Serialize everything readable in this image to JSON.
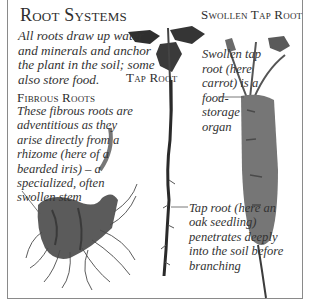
{
  "title": "Root Systems",
  "intro": "All roots draw up water and minerals and anchor the plant in the soil; some also store food.",
  "sections": {
    "fibrous": {
      "heading": "Fibrous Roots",
      "caption": "These fibrous roots are adventitious as they arise directly from a rhizome (here of a bearded iris) – a specialized, often swollen stem",
      "specimen": "bearded iris rhizome"
    },
    "tap": {
      "heading": "Tap Root",
      "caption": "Tap root (here an oak seedling) penetrates deeply into the soil before branching",
      "specimen": "oak seedling"
    },
    "swollen": {
      "heading": "Swollen Tap Root",
      "caption": "Swollen tap root (here carrot) is a food-storage organ",
      "specimen": "carrot"
    }
  },
  "colors": {
    "background": "#ffffff",
    "frame": "#8a8a8a",
    "text": "#2e2e2e",
    "carrot": "#6b6b6b",
    "foliage": "#3c3c3c"
  }
}
